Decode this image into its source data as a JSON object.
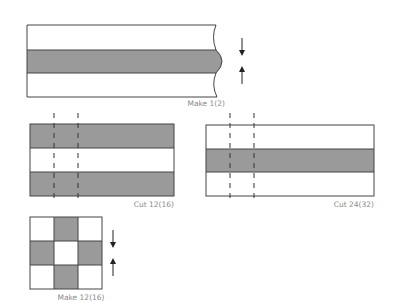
{
  "colors": {
    "fabric_dark": "#9a9a9a",
    "fabric_light": "#ffffff",
    "outline": "#444444",
    "label": "#8a8a8a"
  },
  "steps": [
    {
      "id": "strip-set",
      "label": "Make 1(2)",
      "description": "Sew strip set: light / dark / light, press toward center",
      "bands": [
        "light",
        "dark",
        "light"
      ],
      "arrows": [
        "down",
        "up"
      ]
    },
    {
      "id": "cut-dark-strip-set",
      "label": "Cut 12(16)",
      "description": "Dark / light / dark strip set with two cut lines",
      "bands": [
        "dark",
        "light",
        "dark"
      ],
      "cut_lines": 2
    },
    {
      "id": "cut-light-strip-set",
      "label": "Cut 24(32)",
      "description": "Light / dark / light strip set with two cut lines",
      "bands": [
        "light",
        "dark",
        "light"
      ],
      "cut_lines": 2
    },
    {
      "id": "nine-patch",
      "label": "Make 12(16)",
      "description": "Nine-patch block assembly",
      "grid": [
        [
          "light",
          "dark",
          "light"
        ],
        [
          "dark",
          "light",
          "dark"
        ],
        [
          "light",
          "dark",
          "light"
        ]
      ],
      "arrows": [
        "down",
        "up"
      ]
    }
  ]
}
